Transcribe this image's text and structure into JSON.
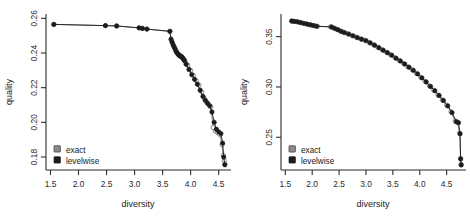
{
  "figure": {
    "panel_count": 2,
    "background": "#ffffff",
    "colors": {
      "exact": "#8a8a8a",
      "levelwise": "#1c1c1c",
      "axis": "#2b2b2b"
    }
  },
  "chart_data": [
    {
      "type": "scatter",
      "panel": "left",
      "title": "",
      "xlabel": "diversity",
      "ylabel": "quality",
      "xlim": [
        1.42,
        4.72
      ],
      "ylim": [
        0.1725,
        0.2625
      ],
      "xticks": [
        "1.5",
        "2.0",
        "2.5",
        "3.0",
        "3.5",
        "4.0",
        "4.5"
      ],
      "xtick_values": [
        1.5,
        2.0,
        2.5,
        3.0,
        3.5,
        4.0,
        4.5
      ],
      "yticks": [
        "0.18",
        "0.20",
        "0.22",
        "0.24",
        "0.26"
      ],
      "ytick_values": [
        0.18,
        0.2,
        0.22,
        0.24,
        0.26
      ],
      "grid": false,
      "legend_position": "bottom-left",
      "series": [
        {
          "name": "exact",
          "marker": "open-circle",
          "color": "#8a8a8a",
          "x": [
            1.56,
            2.48,
            2.68,
            3.08,
            3.14,
            3.22,
            3.63,
            3.66,
            3.68,
            3.7,
            3.72,
            3.74,
            3.76,
            3.78,
            3.8,
            3.82,
            3.84,
            3.86,
            3.88,
            3.9,
            3.95,
            4.0,
            4.05,
            4.1,
            4.15,
            4.2,
            4.24,
            4.28,
            4.32,
            4.36,
            4.4,
            4.44,
            4.48,
            4.52,
            4.56,
            4.58,
            4.6,
            4.61
          ],
          "y": [
            0.2565,
            0.2558,
            0.2556,
            0.2545,
            0.2542,
            0.2538,
            0.2525,
            0.247,
            0.2455,
            0.244,
            0.2425,
            0.241,
            0.24,
            0.2392,
            0.2385,
            0.2382,
            0.2378,
            0.2372,
            0.2362,
            0.2352,
            0.233,
            0.23,
            0.227,
            0.224,
            0.2215,
            0.2175,
            0.214,
            0.212,
            0.2105,
            0.209,
            0.197,
            0.195,
            0.194,
            0.193,
            0.187,
            0.181,
            0.178,
            0.176
          ]
        },
        {
          "name": "levelwise",
          "marker": "filled-circle",
          "color": "#1c1c1c",
          "x": [
            1.56,
            2.48,
            2.68,
            3.08,
            3.14,
            3.22,
            3.63,
            3.65,
            3.67,
            3.69,
            3.71,
            3.73,
            3.75,
            3.77,
            3.79,
            3.81,
            3.83,
            3.85,
            3.87,
            3.89,
            3.92,
            3.97,
            4.02,
            4.07,
            4.12,
            4.17,
            4.22,
            4.26,
            4.3,
            4.34,
            4.38,
            4.42,
            4.46,
            4.5,
            4.54,
            4.57,
            4.59,
            4.61
          ],
          "y": [
            0.2565,
            0.2558,
            0.2556,
            0.2545,
            0.2542,
            0.2538,
            0.2525,
            0.248,
            0.2462,
            0.2445,
            0.2432,
            0.2418,
            0.2405,
            0.2396,
            0.2388,
            0.2384,
            0.238,
            0.2374,
            0.2366,
            0.2356,
            0.2335,
            0.2305,
            0.2275,
            0.2248,
            0.222,
            0.2185,
            0.215,
            0.2128,
            0.211,
            0.2095,
            0.206,
            0.2,
            0.196,
            0.1945,
            0.1935,
            0.188,
            0.18,
            0.1755
          ]
        }
      ],
      "legend": [
        {
          "label": "exact",
          "color": "#8a8a8a"
        },
        {
          "label": "levelwise",
          "color": "#1c1c1c"
        }
      ]
    },
    {
      "type": "scatter",
      "panel": "right",
      "title": "",
      "xlabel": "diversity",
      "ylabel": "quality",
      "xlim": [
        1.42,
        4.86
      ],
      "ylim": [
        0.2175,
        0.3725
      ],
      "xticks": [
        "1.5",
        "2.0",
        "2.5",
        "3.0",
        "3.5",
        "4.0",
        "4.5"
      ],
      "xtick_values": [
        1.5,
        2.0,
        2.5,
        3.0,
        3.5,
        4.0,
        4.5
      ],
      "yticks": [
        "0.25",
        "0.30",
        "0.35"
      ],
      "ytick_values": [
        0.25,
        0.3,
        0.35
      ],
      "grid": false,
      "legend_position": "bottom-left",
      "series": [
        {
          "name": "exact",
          "marker": "open-circle",
          "color": "#8a8a8a",
          "x": [
            1.62,
            1.68,
            1.74,
            1.8,
            1.86,
            1.92,
            1.98,
            2.04,
            2.1,
            2.34,
            2.4,
            2.46,
            2.52,
            2.58,
            2.66,
            2.74,
            2.82,
            2.9,
            2.98,
            3.06,
            3.14,
            3.22,
            3.3,
            3.38,
            3.46,
            3.54,
            3.62,
            3.7,
            3.78,
            3.86,
            3.94,
            4.02,
            4.1,
            4.18,
            4.26,
            4.34,
            4.42,
            4.5,
            4.58,
            4.66,
            4.7,
            4.74,
            4.76,
            4.77
          ],
          "y": [
            0.3655,
            0.365,
            0.3645,
            0.3638,
            0.363,
            0.3622,
            0.3615,
            0.3608,
            0.3602,
            0.3598,
            0.3585,
            0.357,
            0.3556,
            0.3545,
            0.353,
            0.351,
            0.3495,
            0.3478,
            0.3465,
            0.3442,
            0.342,
            0.3395,
            0.337,
            0.3345,
            0.332,
            0.329,
            0.3262,
            0.3232,
            0.32,
            0.317,
            0.3135,
            0.3095,
            0.3055,
            0.301,
            0.2968,
            0.292,
            0.287,
            0.282,
            0.2755,
            0.266,
            0.265,
            0.254,
            0.229,
            0.223
          ]
        },
        {
          "name": "levelwise",
          "marker": "filled-circle",
          "color": "#1c1c1c",
          "x": [
            1.62,
            1.66,
            1.72,
            1.78,
            1.84,
            1.9,
            1.96,
            2.02,
            2.08,
            2.36,
            2.42,
            2.48,
            2.54,
            2.6,
            2.68,
            2.76,
            2.84,
            2.92,
            3.0,
            3.08,
            3.16,
            3.24,
            3.32,
            3.4,
            3.48,
            3.56,
            3.64,
            3.72,
            3.8,
            3.88,
            3.96,
            4.04,
            4.12,
            4.2,
            4.28,
            4.36,
            4.44,
            4.52,
            4.6,
            4.68,
            4.72,
            4.75,
            4.76,
            4.77
          ],
          "y": [
            0.3655,
            0.3652,
            0.3648,
            0.364,
            0.3632,
            0.3625,
            0.3618,
            0.361,
            0.3604,
            0.3596,
            0.3582,
            0.3568,
            0.3552,
            0.354,
            0.3525,
            0.3508,
            0.349,
            0.3474,
            0.346,
            0.3438,
            0.3415,
            0.339,
            0.3365,
            0.334,
            0.3315,
            0.3285,
            0.3258,
            0.3228,
            0.3196,
            0.3165,
            0.313,
            0.309,
            0.305,
            0.3005,
            0.2962,
            0.2915,
            0.2865,
            0.2812,
            0.2745,
            0.2655,
            0.2645,
            0.2535,
            0.2285,
            0.2225
          ]
        }
      ],
      "legend": [
        {
          "label": "exact",
          "color": "#8a8a8a"
        },
        {
          "label": "levelwise",
          "color": "#1c1c1c"
        }
      ]
    }
  ]
}
